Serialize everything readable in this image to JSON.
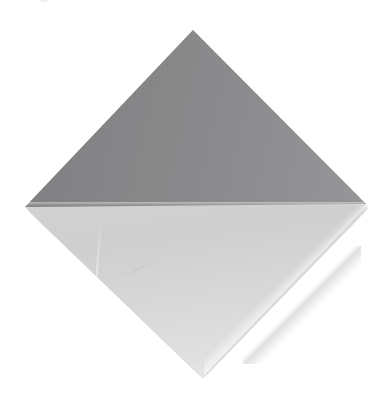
{
  "image": {
    "subject": "folded-napkin",
    "description": "Photograph of a square paper napkin rotated 45 degrees into a diamond, with its top half folded down toward the viewer",
    "orientation": "diamond",
    "background_color": "#ffffff",
    "width": 391,
    "height": 394
  },
  "shape": {
    "name": "diamond",
    "vertices": {
      "top": {
        "x": 193,
        "y": 30
      },
      "right": {
        "x": 366,
        "y": 204
      },
      "bottom": {
        "x": 200,
        "y": 375
      },
      "left": {
        "x": 25,
        "y": 207
      }
    },
    "fold_line_y": 202
  },
  "regions": [
    {
      "name": "upper-folded-flap",
      "label": "Upper folded triangle",
      "tone": "dark-gray",
      "color": "#8a8a8c",
      "color_light": "#98989a",
      "color_dark": "#7e7e80"
    },
    {
      "name": "lower-panel",
      "label": "Lower triangle",
      "tone": "light-gray",
      "color": "#d4d4d4",
      "color_light": "#e6e6e6",
      "color_dark": "#cfcfcf"
    }
  ],
  "details": [
    {
      "name": "fold-crease",
      "label": "Horizontal fold crease"
    },
    {
      "name": "layered-edge-right",
      "label": "Layered sheet edge, lower right"
    },
    {
      "name": "layered-edge-corner",
      "label": "Secondary fold edge near bottom corner"
    },
    {
      "name": "crease-left",
      "label": "Faint crease on lower left panel"
    },
    {
      "name": "drop-shadow",
      "label": "Soft drop shadow"
    },
    {
      "name": "top-edge-artifact",
      "label": "Cropped artifact at top edge"
    }
  ]
}
